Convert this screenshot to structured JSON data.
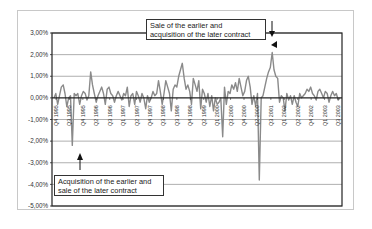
{
  "chart_data": {
    "type": "line",
    "title": "",
    "xlabel": "",
    "ylabel": "",
    "ylim": [
      -5.0,
      3.0
    ],
    "yticks": [
      "3,00%",
      "2,00%",
      "1,00%",
      "0,00%",
      "-1,00%",
      "-2,00%",
      "-3,00%",
      "-4,00%",
      "-5,00%"
    ],
    "ytick_values": [
      3,
      2,
      1,
      0,
      -1,
      -2,
      -3,
      -4,
      -5
    ],
    "grid": true,
    "legend": null,
    "x_tick_labels": [
      "Q4 1995",
      "Q3 1995",
      "Q4 1995",
      "Q2 1996",
      "Q3 1996",
      "Q1 1997",
      "Q2 1997",
      "Q4 1997",
      "Q3 1998",
      "Q3 1998",
      "Q4 1998",
      "Q2 1999",
      "Q1 2000",
      "Q3 2000",
      "Q4 2000",
      "Q2 2000",
      "Q3 2001",
      "Q1 2002",
      "Q2 2002",
      "Q4 2002",
      "Q1 2003",
      "Q3 2003"
    ],
    "series": [
      {
        "name": "spread",
        "color": "#8a8a8a",
        "values": [
          0.0,
          0.2,
          -0.3,
          0.1,
          0.5,
          0.6,
          0.2,
          -0.4,
          0.0,
          0.1,
          -2.2,
          0.2,
          0.1,
          0.2,
          -0.3,
          0.1,
          0.3,
          0.2,
          -0.1,
          0.1,
          1.2,
          0.6,
          0.2,
          -0.2,
          0.1,
          0.3,
          0.5,
          0.2,
          -0.3,
          0.4,
          0.5,
          0.2,
          0.1,
          -0.2,
          0.1,
          0.3,
          0.1,
          -0.1,
          0.2,
          0.1,
          0.5,
          -0.4,
          0.1,
          0.2,
          -0.3,
          0.3,
          0.1,
          -0.2,
          0.2,
          0.0,
          -0.5,
          0.1,
          -0.2,
          0.0,
          0.3,
          0.1,
          0.2,
          0.8,
          0.3,
          -0.3,
          0.2,
          0.8,
          0.5,
          0.2,
          -0.6,
          0.4,
          0.6,
          0.5,
          1.0,
          1.3,
          1.6,
          0.9,
          0.4,
          0.6,
          0.3,
          -0.3,
          0.9,
          0.6,
          0.3,
          0.8,
          -0.5,
          0.4,
          0.2,
          -0.2,
          0.2,
          -0.4,
          0.1,
          -0.6,
          0.0,
          -0.3,
          -0.2,
          0.0,
          -1.8,
          0.5,
          -0.3,
          0.3,
          0.2,
          0.6,
          0.4,
          0.7,
          0.3,
          0.9,
          0.5,
          0.1,
          0.3,
          0.8,
          1.0,
          0.5,
          -0.3,
          0.1,
          -0.4,
          0.2,
          -3.8,
          0.0,
          0.1,
          0.5,
          0.9,
          1.2,
          1.4,
          2.1,
          1.3,
          1.0,
          0.9,
          -0.2,
          0.1,
          0.0,
          -0.6,
          0.2,
          -0.1,
          0.1,
          -0.3,
          0.1,
          -0.2,
          -0.4,
          0.2,
          0.0,
          0.1,
          0.2,
          0.4,
          0.3,
          0.5,
          0.2,
          0.1,
          -0.1,
          0.3,
          0.4,
          0.2,
          0.0,
          0.3,
          0.2,
          -0.2,
          0.1,
          0.3,
          0.1,
          0.2,
          -0.1,
          0.0
        ]
      }
    ],
    "annotations": [
      {
        "text_line1": "Sale of the earlier and",
        "text_line2": "acquisition of the later contract",
        "points_to": "peak ~2.1% around Q1 2001"
      },
      {
        "text_line1": "Acquisition of the earlier and",
        "text_line2": "sale of the later contract",
        "points_to": "trough ~-2.2% around Q4 1995/Q1 1996"
      }
    ]
  },
  "annotations": {
    "top": {
      "line1": "Sale of the earlier and",
      "line2": "acquisition of the later contract"
    },
    "bottom": {
      "line1": "Acquisition of the earlier and",
      "line2": "sale of the later contract"
    }
  },
  "colors": {
    "series": "#8a8a8a",
    "axis": "#222222",
    "grid": "#9a9a9a",
    "frame": "#c8c8c8"
  }
}
